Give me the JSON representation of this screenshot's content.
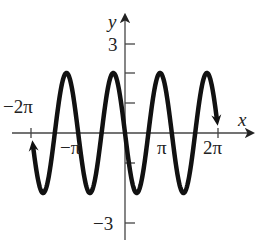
{
  "chart_data": {
    "type": "line",
    "title": "",
    "function": "y = -2 sin(2x)",
    "xlabel": "x",
    "ylabel": "y",
    "xlim": [
      -6.2832,
      6.2832
    ],
    "ylim": [
      -3,
      3
    ],
    "x_ticks": [
      {
        "value": -6.2832,
        "label": "−2π"
      },
      {
        "value": -3.1416,
        "label": "−π"
      },
      {
        "value": 3.1416,
        "label": "π"
      },
      {
        "value": 6.2832,
        "label": "2π"
      }
    ],
    "y_ticks": [
      {
        "value": 3,
        "label": "3"
      },
      {
        "value": 2,
        "label": ""
      },
      {
        "value": 1,
        "label": ""
      },
      {
        "value": -1,
        "label": ""
      },
      {
        "value": -3,
        "label": "−3"
      }
    ],
    "series": [
      {
        "name": "curve",
        "amplitude": 2,
        "period": 3.1416,
        "arrows_at_ends": true,
        "x": [
          -6.2832,
          -5.4978,
          -4.7124,
          -3.927,
          -3.1416,
          -2.3562,
          -1.5708,
          -0.7854,
          0,
          0.7854,
          1.5708,
          2.3562,
          3.1416,
          3.927,
          4.7124,
          5.4978,
          6.2832
        ],
        "y": [
          0,
          -2,
          0,
          -2,
          0,
          -2,
          0,
          2,
          0,
          -2,
          0,
          -2,
          0,
          -2,
          0,
          -2,
          0
        ]
      }
    ],
    "grid": false,
    "legend": "none"
  },
  "labels": {
    "x_axis": "x",
    "y_axis": "y",
    "y3": "3",
    "yneg3": "−3",
    "xneg2pi": "−2π",
    "xnegpi": "−π",
    "xpi": "π",
    "x2pi": "2π"
  }
}
